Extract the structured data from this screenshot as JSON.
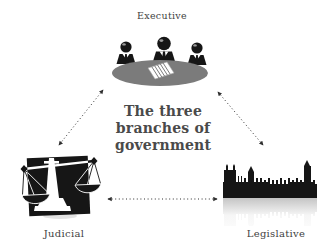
{
  "diagram": {
    "title": {
      "text": "The three branches of government",
      "lines": [
        "The three",
        "branches of",
        "government"
      ]
    },
    "nodes": {
      "executive": {
        "label": "Executive",
        "icon": "cabinet-meeting-table-icon",
        "position": "top-center"
      },
      "judicial": {
        "label": "Judicial",
        "icon": "scales-of-justice-icon",
        "position": "bottom-left"
      },
      "legislative": {
        "label": "Legislative",
        "icon": "parliament-building-icon",
        "position": "bottom-right"
      }
    },
    "connectors": [
      {
        "from": "executive",
        "to": "judicial",
        "style": "dotted",
        "arrowheads": "both"
      },
      {
        "from": "executive",
        "to": "legislative",
        "style": "dotted",
        "arrowheads": "both"
      },
      {
        "from": "judicial",
        "to": "legislative",
        "style": "dotted",
        "arrowheads": "both"
      }
    ],
    "colors": {
      "background": "#ffffff",
      "icon_black": "#161616",
      "table_gray": "#7b7b7b",
      "title_text": "#4a4a4a",
      "label_text": "#3f3f3f",
      "arrow": "#2e2e2e"
    }
  }
}
